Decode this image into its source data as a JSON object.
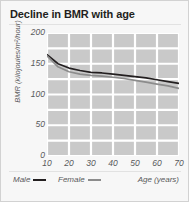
{
  "card": {
    "title": "Decline in BMR with age"
  },
  "legend": {
    "male_label": "Male",
    "female_label": "Female",
    "xaxis_title": "Age (years)"
  },
  "colors": {
    "male_line": "#231f20",
    "female_line": "#8c8c8c",
    "plot_background": "#c9c9c9",
    "gridline": "#ffffff",
    "card_background": "#f7f7f7",
    "text": "#58595b",
    "title_text": "#231f20"
  },
  "chart_data": {
    "type": "line",
    "title": "Decline in BMR with age",
    "xlabel": "Age (years)",
    "ylabel": "BMR (kilojoules/m²/hour)",
    "xlim": [
      10,
      70
    ],
    "ylim": [
      0,
      200
    ],
    "xticks": [
      10,
      20,
      30,
      40,
      50,
      60,
      70
    ],
    "yticks": [
      0,
      50,
      100,
      150,
      200
    ],
    "grid": true,
    "legend_position": "below-left",
    "x": [
      10,
      15,
      20,
      25,
      30,
      35,
      40,
      45,
      50,
      55,
      60,
      65,
      70
    ],
    "series": [
      {
        "name": "Male",
        "color": "#231f20",
        "values": [
          165,
          150,
          143,
          139,
          136,
          135,
          133,
          131,
          129,
          127,
          124,
          121,
          118
        ]
      },
      {
        "name": "Female",
        "color": "#8c8c8c",
        "values": [
          163,
          145,
          137,
          133,
          131,
          130,
          128,
          126,
          123,
          120,
          117,
          114,
          110
        ]
      }
    ]
  }
}
